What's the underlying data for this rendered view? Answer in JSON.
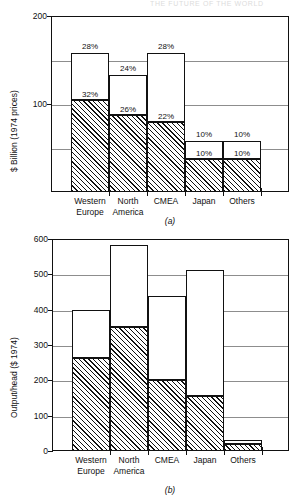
{
  "header": {
    "cut_text": "THE FUTURE OF THE WORLD"
  },
  "charts": [
    {
      "id": "chart-a",
      "caption": "(a)",
      "chart_data": {
        "type": "bar",
        "subtype": "stacked",
        "title": "",
        "xlabel": "",
        "ylabel": "$ Billion (1974 prices)",
        "ylim": [
          0,
          200
        ],
        "yticks_labeled": [
          100,
          200
        ],
        "ytick_labels": [
          "100",
          "200"
        ],
        "gridlines": [
          50,
          100,
          150,
          200
        ],
        "grid": true,
        "legend": "none",
        "categories": [
          "Western Europe",
          "North America",
          "CMEA",
          "Japan",
          "Others"
        ],
        "series": [
          {
            "name": "Lower (hatched)",
            "fill": "hatched",
            "values": [
              105,
              88,
              80,
              38,
              38
            ],
            "labels": [
              "32%",
              "26%",
              "22%",
              "10%",
              "10%"
            ]
          },
          {
            "name": "Upper (open)",
            "fill": "white",
            "values": [
              53,
              45,
              78,
              20,
              20
            ],
            "labels": [
              "28%",
              "24%",
              "28%",
              "10%",
              "10%"
            ]
          }
        ],
        "totals": [
          158,
          133,
          158,
          58,
          58
        ]
      }
    },
    {
      "id": "chart-b",
      "caption": "(b)",
      "chart_data": {
        "type": "bar",
        "subtype": "stacked",
        "title": "",
        "xlabel": "",
        "ylabel": "Output/head ($ 1974)",
        "ylim": [
          0,
          600
        ],
        "yticks_labeled": [
          0,
          100,
          200,
          300,
          400,
          500,
          600
        ],
        "ytick_labels": [
          "0",
          "100",
          "200",
          "300",
          "400",
          "500",
          "600"
        ],
        "gridlines": [
          100,
          200,
          300,
          400,
          500,
          600
        ],
        "grid": true,
        "legend": "none",
        "categories": [
          "Western Europe",
          "North America",
          "CMEA",
          "Japan",
          "Others"
        ],
        "series": [
          {
            "name": "Lower (hatched)",
            "fill": "hatched",
            "values": [
              262,
              352,
              200,
              155,
              20
            ]
          },
          {
            "name": "Upper (open)",
            "fill": "white",
            "values": [
              138,
              232,
              238,
              358,
              10
            ]
          }
        ],
        "totals": [
          400,
          584,
          438,
          513,
          30
        ]
      }
    }
  ]
}
